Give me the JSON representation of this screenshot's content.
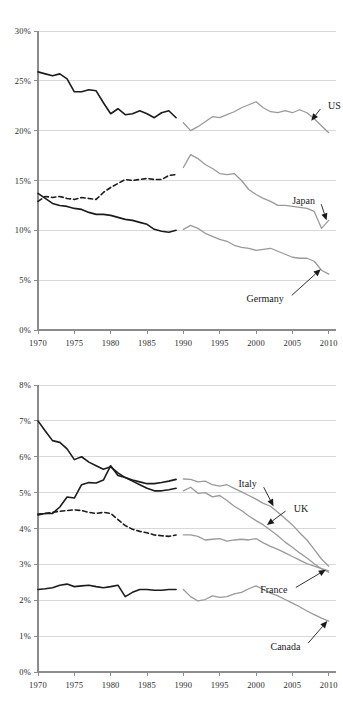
{
  "figure": {
    "background": "#ffffff",
    "historical_color": "#1c1c1c",
    "projection_color": "#9a9a9a",
    "gridline_color": "#d9d9d9",
    "axis_color": "#8c8c8c"
  },
  "chart_data": [
    {
      "id": "top",
      "type": "line",
      "title": "",
      "subtitle": "",
      "xlabel": "",
      "ylabel": "",
      "xlim": [
        1970,
        2011
      ],
      "ylim": [
        0,
        30
      ],
      "grid": true,
      "legend_position": "inline-annotations",
      "x_ticks": [
        1970,
        1975,
        1980,
        1985,
        1990,
        1995,
        2000,
        2005,
        2010
      ],
      "x_tick_labels": [
        "1970",
        "1975",
        "1980",
        "1985",
        "1990",
        "1995",
        "2000",
        "2005",
        "2010"
      ],
      "y_ticks": [
        0,
        5,
        10,
        15,
        20,
        25,
        30
      ],
      "y_tick_labels": [
        "0%",
        "5%",
        "10%",
        "15%",
        "20%",
        "25%",
        "30%"
      ],
      "series": [
        {
          "name": "US",
          "style_historical": "solid",
          "label_x": 2009.2,
          "label_y": 22.5,
          "arrow_to_x": 2007.6,
          "arrow_to_y": 21.0,
          "historical": {
            "x": [
              1970,
              1971,
              1972,
              1973,
              1974,
              1975,
              1976,
              1977,
              1978,
              1979,
              1980,
              1981,
              1982,
              1983,
              1984,
              1985,
              1986,
              1987,
              1988,
              1989
            ],
            "y": [
              25.9,
              25.7,
              25.5,
              25.7,
              25.2,
              23.9,
              23.9,
              24.1,
              24.0,
              22.8,
              21.7,
              22.2,
              21.6,
              21.7,
              22.0,
              21.7,
              21.3,
              21.8,
              22.0,
              21.3
            ]
          },
          "projection": {
            "x": [
              1990,
              1991,
              1992,
              1993,
              1994,
              1995,
              1996,
              1997,
              1998,
              1999,
              2000,
              2001,
              2002,
              2003,
              2004,
              2005,
              2006,
              2007,
              2008,
              2009,
              2010
            ],
            "y": [
              20.8,
              20.0,
              20.4,
              20.9,
              21.4,
              21.3,
              21.6,
              21.9,
              22.3,
              22.6,
              22.9,
              22.3,
              21.9,
              21.8,
              22.0,
              21.8,
              22.1,
              21.8,
              21.2,
              20.5,
              19.8
            ]
          }
        },
        {
          "name": "Japan",
          "style_historical": "dashed",
          "label_x": 2008.8,
          "label_y": 13.0,
          "arrow_to_x": 2009.7,
          "arrow_to_y": 11.0,
          "historical": {
            "x": [
              1970,
              1971,
              1972,
              1973,
              1974,
              1975,
              1976,
              1977,
              1978,
              1979,
              1980,
              1981,
              1982,
              1983,
              1984,
              1985,
              1986,
              1987,
              1988,
              1989
            ],
            "y": [
              12.9,
              13.4,
              13.3,
              13.4,
              13.2,
              13.1,
              13.3,
              13.2,
              13.1,
              13.8,
              14.3,
              14.7,
              15.1,
              15.0,
              15.1,
              15.2,
              15.1,
              15.1,
              15.5,
              15.6
            ]
          },
          "projection": {
            "x": [
              1990,
              1991,
              1992,
              1993,
              1994,
              1995,
              1996,
              1997,
              1998,
              1999,
              2000,
              2001,
              2002,
              2003,
              2004,
              2005,
              2006,
              2007,
              2008,
              2009,
              2010
            ],
            "y": [
              16.3,
              17.6,
              17.2,
              16.6,
              16.2,
              15.7,
              15.6,
              15.7,
              15.0,
              14.1,
              13.6,
              13.2,
              12.9,
              12.5,
              12.5,
              12.4,
              12.3,
              12.2,
              11.9,
              10.2,
              11.0
            ]
          }
        },
        {
          "name": "Germany",
          "style_historical": "solid",
          "label_x": 2004.5,
          "label_y": 3.2,
          "arrow_to_x": 2008.9,
          "arrow_to_y": 6.1,
          "historical": {
            "x": [
              1970,
              1971,
              1972,
              1973,
              1974,
              1975,
              1976,
              1977,
              1978,
              1979,
              1980,
              1981,
              1982,
              1983,
              1984,
              1985,
              1986,
              1987,
              1988,
              1989
            ],
            "y": [
              13.7,
              13.2,
              12.7,
              12.5,
              12.4,
              12.2,
              12.1,
              11.8,
              11.6,
              11.6,
              11.5,
              11.3,
              11.1,
              11.0,
              10.8,
              10.6,
              10.1,
              9.9,
              9.8,
              10.0
            ]
          },
          "projection": {
            "x": [
              1990,
              1991,
              1992,
              1993,
              1994,
              1995,
              1996,
              1997,
              1998,
              1999,
              2000,
              2001,
              2002,
              2003,
              2004,
              2005,
              2006,
              2007,
              2008,
              2009,
              2010
            ],
            "y": [
              10.1,
              10.5,
              10.2,
              9.7,
              9.4,
              9.1,
              8.9,
              8.5,
              8.3,
              8.2,
              8.0,
              8.1,
              8.2,
              7.9,
              7.6,
              7.3,
              7.2,
              7.2,
              6.9,
              6.0,
              5.6
            ]
          }
        }
      ]
    },
    {
      "id": "bottom",
      "type": "line",
      "title": "",
      "subtitle": "",
      "xlabel": "",
      "ylabel": "",
      "xlim": [
        1970,
        2011
      ],
      "ylim": [
        0,
        8
      ],
      "grid": true,
      "legend_position": "inline-annotations",
      "x_ticks": [
        1970,
        1975,
        1980,
        1985,
        1990,
        1995,
        2000,
        2005,
        2010
      ],
      "x_tick_labels": [
        "1970",
        "1975",
        "1980",
        "1985",
        "1990",
        "1995",
        "2000",
        "2005",
        "2010"
      ],
      "y_ticks": [
        0,
        1,
        2,
        3,
        4,
        5,
        6,
        7,
        8
      ],
      "y_tick_labels": [
        "0%",
        "1%",
        "2%",
        "3%",
        "4%",
        "5%",
        "6%",
        "7%",
        "8%"
      ],
      "series": [
        {
          "name": "Italy",
          "style_historical": "solid",
          "label_x": 2000.8,
          "label_y": 5.25,
          "arrow_to_x": 2002.4,
          "arrow_to_y": 4.62,
          "historical": {
            "x": [
              1970,
              1971,
              1972,
              1973,
              1974,
              1975,
              1976,
              1977,
              1978,
              1979,
              1980,
              1981,
              1982,
              1983,
              1984,
              1985,
              1986,
              1987,
              1988,
              1989
            ],
            "y": [
              4.38,
              4.42,
              4.42,
              4.6,
              4.88,
              4.85,
              5.22,
              5.28,
              5.27,
              5.35,
              5.75,
              5.48,
              5.42,
              5.35,
              5.3,
              5.25,
              5.25,
              5.28,
              5.32,
              5.37
            ]
          },
          "projection": {
            "x": [
              1990,
              1991,
              1992,
              1993,
              1994,
              1995,
              1996,
              1997,
              1998,
              1999,
              2000,
              2001,
              2002,
              2003,
              2004,
              2005,
              2006,
              2007,
              2008,
              2009,
              2010
            ],
            "y": [
              5.38,
              5.37,
              5.3,
              5.32,
              5.22,
              5.18,
              5.22,
              5.12,
              5.02,
              4.92,
              4.82,
              4.7,
              4.62,
              4.45,
              4.28,
              4.1,
              3.88,
              3.68,
              3.42,
              3.15,
              2.95
            ]
          }
        },
        {
          "name": "UK",
          "style_historical": "solid",
          "label_x": 2004.5,
          "label_y": 4.55,
          "arrow_to_x": 2001.5,
          "arrow_to_y": 4.1,
          "historical": {
            "x": [
              1970,
              1971,
              1972,
              1973,
              1974,
              1975,
              1976,
              1977,
              1978,
              1979,
              1980,
              1981,
              1982,
              1983,
              1984,
              1985,
              1986,
              1987,
              1988,
              1989
            ],
            "y": [
              7.0,
              6.72,
              6.45,
              6.4,
              6.22,
              5.92,
              6.0,
              5.85,
              5.75,
              5.65,
              5.72,
              5.55,
              5.42,
              5.32,
              5.22,
              5.12,
              5.05,
              5.05,
              5.08,
              5.12
            ]
          },
          "projection": {
            "x": [
              1990,
              1991,
              1992,
              1993,
              1994,
              1995,
              1996,
              1997,
              1998,
              1999,
              2000,
              2001,
              2002,
              2003,
              2004,
              2005,
              2006,
              2007,
              2008,
              2009,
              2010
            ],
            "y": [
              5.05,
              5.15,
              4.98,
              5.0,
              4.88,
              4.92,
              4.78,
              4.62,
              4.5,
              4.35,
              4.22,
              4.1,
              3.95,
              3.8,
              3.62,
              3.48,
              3.32,
              3.18,
              3.02,
              2.88,
              2.78
            ]
          }
        },
        {
          "name": "France",
          "style_historical": "dashed",
          "label_x": 2005.0,
          "label_y": 2.3,
          "arrow_to_x": 2009.6,
          "arrow_to_y": 2.85,
          "historical": {
            "x": [
              1970,
              1971,
              1972,
              1973,
              1974,
              1975,
              1976,
              1977,
              1978,
              1979,
              1980,
              1981,
              1982,
              1983,
              1984,
              1985,
              1986,
              1987,
              1988,
              1989
            ],
            "y": [
              4.4,
              4.42,
              4.45,
              4.48,
              4.5,
              4.52,
              4.5,
              4.45,
              4.42,
              4.45,
              4.42,
              4.25,
              4.08,
              3.98,
              3.92,
              3.88,
              3.82,
              3.8,
              3.78,
              3.82
            ]
          },
          "projection": {
            "x": [
              1990,
              1991,
              1992,
              1993,
              1994,
              1995,
              1996,
              1997,
              1998,
              1999,
              2000,
              2001,
              2002,
              2003,
              2004,
              2005,
              2006,
              2007,
              2008,
              2009,
              2010
            ],
            "y": [
              3.82,
              3.82,
              3.78,
              3.68,
              3.7,
              3.72,
              3.65,
              3.68,
              3.7,
              3.68,
              3.72,
              3.6,
              3.5,
              3.42,
              3.32,
              3.22,
              3.12,
              3.02,
              2.95,
              2.88,
              2.82
            ]
          }
        },
        {
          "name": "Canada",
          "style_historical": "solid",
          "label_x": 2006.8,
          "label_y": 0.72,
          "arrow_to_x": 2009.8,
          "arrow_to_y": 1.42,
          "historical": {
            "x": [
              1970,
              1971,
              1972,
              1973,
              1974,
              1975,
              1976,
              1977,
              1978,
              1979,
              1980,
              1981,
              1982,
              1983,
              1984,
              1985,
              1986,
              1987,
              1988,
              1989
            ],
            "y": [
              2.3,
              2.32,
              2.35,
              2.42,
              2.45,
              2.38,
              2.4,
              2.42,
              2.38,
              2.35,
              2.38,
              2.42,
              2.1,
              2.22,
              2.3,
              2.3,
              2.28,
              2.28,
              2.3,
              2.3
            ]
          },
          "projection": {
            "x": [
              1990,
              1991,
              1992,
              1993,
              1994,
              1995,
              1996,
              1997,
              1998,
              1999,
              2000,
              2001,
              2002,
              2003,
              2004,
              2005,
              2006,
              2007,
              2008,
              2009,
              2010
            ],
            "y": [
              2.3,
              2.1,
              1.98,
              2.02,
              2.12,
              2.08,
              2.1,
              2.18,
              2.22,
              2.32,
              2.4,
              2.3,
              2.2,
              2.12,
              2.02,
              1.92,
              1.82,
              1.7,
              1.6,
              1.5,
              1.42
            ]
          }
        }
      ]
    }
  ]
}
